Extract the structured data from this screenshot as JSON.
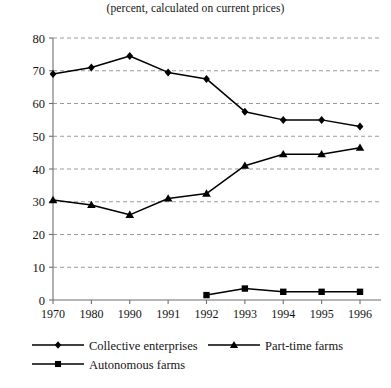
{
  "chart_data": {
    "type": "line",
    "title": "(percent, calculated on current prices)",
    "xlabel": "",
    "ylabel": "",
    "categories": [
      "1970",
      "1980",
      "1990",
      "1991",
      "1992",
      "1993",
      "1994",
      "1995",
      "1996"
    ],
    "ylim": [
      0,
      80
    ],
    "yticks": [
      0,
      10,
      20,
      30,
      40,
      50,
      60,
      70,
      80
    ],
    "ytick_labels": [
      "0",
      "10",
      "20",
      "30",
      "40",
      "50",
      "60",
      "70",
      "80"
    ],
    "grid": "horizontal-dashed",
    "legend_position": "bottom-left",
    "series": [
      {
        "name": "Collective enterprises",
        "marker": "diamond",
        "values": [
          69,
          71,
          74.5,
          69.5,
          67.5,
          57.5,
          55,
          55,
          53
        ]
      },
      {
        "name": "Part-time farms",
        "marker": "triangle",
        "values": [
          30.5,
          29,
          26,
          31,
          32.5,
          41,
          44.5,
          44.5,
          46.5
        ]
      },
      {
        "name": "Autonomous farms",
        "marker": "square",
        "values": [
          null,
          null,
          null,
          null,
          1.5,
          3.5,
          2.5,
          2.5,
          2.5
        ]
      }
    ]
  },
  "legend": {
    "items": [
      {
        "label": "Collective enterprises",
        "marker": "diamond"
      },
      {
        "label": "Part-time farms",
        "marker": "triangle"
      },
      {
        "label": "Autonomous farms",
        "marker": "square"
      }
    ]
  },
  "colors": {
    "line": "#000000",
    "grid": "#8f8f8f",
    "axis": "#6f6f6f",
    "text": "#141414",
    "background": "#ffffff"
  }
}
